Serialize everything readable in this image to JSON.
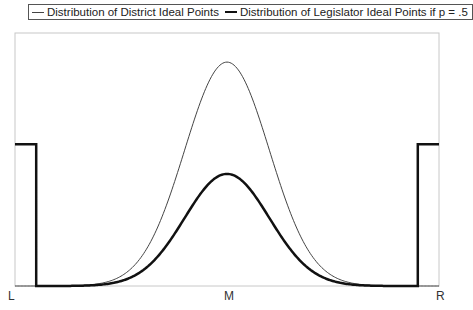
{
  "chart_data": {
    "type": "line",
    "title": "",
    "xlabel": "",
    "ylabel": "",
    "x_tick_labels": [
      "L",
      "M",
      "R"
    ],
    "grid": false,
    "legend_position": "top",
    "legend": [
      "Distribution of District Ideal Points",
      "Distribution of Legislator Ideal Points if p = .5"
    ],
    "x_range": [
      0,
      1
    ],
    "series": [
      {
        "name": "Distribution of District Ideal Points",
        "style": "thin",
        "shape": "normal",
        "center": 0.5,
        "sd": 0.1,
        "peak_relative_height": 0.885
      },
      {
        "name": "Distribution of Legislator Ideal Points if p = .5",
        "style": "thick",
        "shape": "normal (half height) plus uniform steps at extremes",
        "center": 0.5,
        "sd": 0.1,
        "peak_relative_height": 0.443,
        "edge_step_relative_height": 0.56,
        "edge_step_width": 0.05
      }
    ]
  },
  "legend": {
    "item1": "Distribution of District Ideal Points",
    "item2": "Distribution of Legislator Ideal Points if p = .5"
  },
  "axis": {
    "left": "L",
    "middle": "M",
    "right": "R"
  },
  "colors": {
    "thin_line": "#444444",
    "thick_line": "#111111",
    "frame": "#c8c8c8"
  }
}
